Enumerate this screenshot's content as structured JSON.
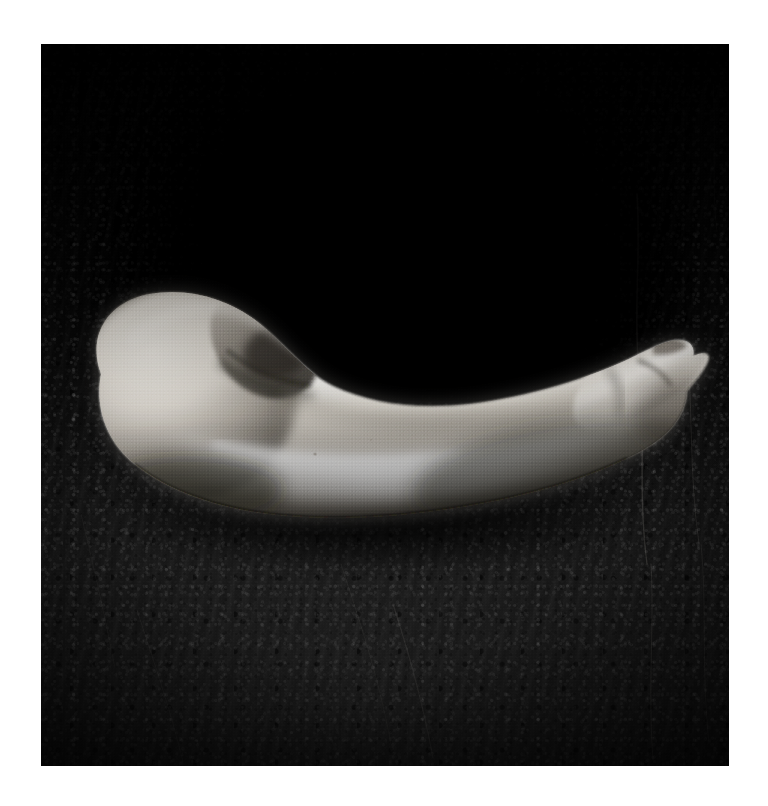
{
  "artwork": {
    "title": "",
    "medium_note": "",
    "orientation": "portrait",
    "color_mode": "black-and-white",
    "canvas": {
      "width_px": 768,
      "height_px": 806,
      "background_hex": "#ffffff"
    },
    "plate": {
      "left_px": 41,
      "top_px": 44,
      "width_px": 688,
      "height_px": 722,
      "border_description": "white paper margin surrounding a square photographic plate"
    },
    "palette": {
      "paper_white": "#ffffff",
      "deepest_black": "#000000",
      "stone_dark": "#101010",
      "stone_mid": "#1d1d1d",
      "stone_light": "#2a2a2a",
      "form_highlight": "#f2f0ec",
      "form_midtone": "#b9b4ac",
      "form_shadow": "#4a463f"
    },
    "subject": {
      "name": "pale elongated organic form",
      "description": "A smooth, tapering, gourd-like object lying horizontally. Bulbous rounded mass at the left with a curled hooked lobe folding over it, sweeping into a long gently S-curved body that narrows to a blunt rounded point at the right, where a small raised ridge and notch interrupt the contour.",
      "lighting": "strong directional light from upper left producing a long specular highlight across the upper belly and a soft falloff to shadow at the lower right",
      "bbox": {
        "left_px": 95,
        "top_px": 300,
        "right_px": 694,
        "bottom_px": 512
      }
    },
    "background": {
      "name": "rough dark stone slab",
      "description": "Coarse pitted slate or granite with diagonal chisel striations, a few bright hairline cracks running vertically on the right, and a deep black shadowed cavity behind and above the subject."
    }
  },
  "caption": {
    "text": ""
  }
}
